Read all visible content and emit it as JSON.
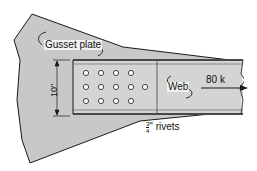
{
  "diagram": {
    "labels": {
      "gusset_plate": "Gusset plate",
      "web": "Web",
      "dimension": "10\"",
      "load": "80 k",
      "rivets_fraction_num": "3",
      "rivets_fraction_den": "4",
      "rivets_text": "\" rivets"
    },
    "colors": {
      "gusset_fill": "#c8c8c8",
      "member_fill": "#d4d4d4",
      "rivet_fill": "#ffffff",
      "line": "#1a1a1a"
    },
    "rivet_rows": [
      {
        "y": 73,
        "xs": [
          86,
          101,
          116,
          131
        ]
      },
      {
        "y": 87,
        "xs": [
          86,
          101,
          116,
          131,
          145
        ]
      },
      {
        "y": 101,
        "xs": [
          86,
          101,
          116,
          131
        ]
      }
    ]
  }
}
